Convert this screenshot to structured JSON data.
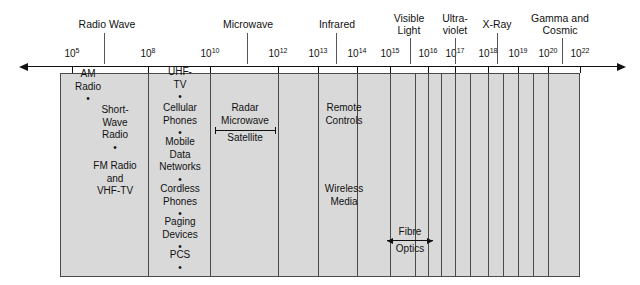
{
  "chart_data": {
    "type": "bar",
    "xlabel": "Frequency (Hz)",
    "ylabel": "",
    "axis_scale": "log10",
    "axis_arrow_left": true,
    "axis_arrow_right": true,
    "grid": false,
    "legend": "none",
    "tick_labels": [
      {
        "base": "10",
        "exp": "5",
        "x": 72
      },
      {
        "base": "10",
        "exp": "8",
        "x": 148
      },
      {
        "base": "10",
        "exp": "10",
        "x": 210
      },
      {
        "base": "10",
        "exp": "12",
        "x": 278
      },
      {
        "base": "10",
        "exp": "13",
        "x": 318
      },
      {
        "base": "10",
        "exp": "14",
        "x": 357
      },
      {
        "base": "10",
        "exp": "15",
        "x": 390
      },
      {
        "base": "10",
        "exp": "16",
        "x": 428
      },
      {
        "base": "10",
        "exp": "17",
        "x": 455
      },
      {
        "base": "10",
        "exp": "18",
        "x": 488
      },
      {
        "base": "10",
        "exp": "19",
        "x": 518
      },
      {
        "base": "10",
        "exp": "20",
        "x": 548
      },
      {
        "base": "10",
        "exp": "22",
        "x": 580
      }
    ],
    "categories": [
      {
        "label_line1": "Radio Wave",
        "label_line2": "",
        "x": 107,
        "leader_x": 104
      },
      {
        "label_line1": "Microwave",
        "label_line2": "",
        "x": 248,
        "leader_x": 247
      },
      {
        "label_line1": "Infrared",
        "label_line2": "",
        "x": 337,
        "leader_x": 336
      },
      {
        "label_line1": "Visible",
        "label_line2": "Light",
        "x": 409,
        "leader_x": 410
      },
      {
        "label_line1": "Ultra-",
        "label_line2": "violet",
        "x": 455,
        "leader_x": 455
      },
      {
        "label_line1": "X-Ray",
        "label_line2": "",
        "x": 497,
        "leader_x": 497
      },
      {
        "label_line1": "Gamma and",
        "label_line2": "Cosmic",
        "x": 560,
        "leader_x": 562
      }
    ],
    "band_dividers": [
      148,
      210,
      278,
      318,
      357,
      390,
      415,
      428,
      441,
      455,
      470,
      488,
      503,
      518,
      533,
      548
    ],
    "technologies": [
      {
        "text": "AM\nRadio\n•",
        "x": 88,
        "y": 68
      },
      {
        "text": "Short-\nWave\nRadio\n•",
        "x": 115,
        "y": 104
      },
      {
        "text": "FM Radio\nand\nVHF-TV",
        "x": 115,
        "y": 160
      },
      {
        "text": "UHF-\nTV\n•",
        "x": 180,
        "y": 66
      },
      {
        "text": "Cellular\nPhones\n•",
        "x": 180,
        "y": 102
      },
      {
        "text": "Mobile\nData\nNetworks\n•",
        "x": 180,
        "y": 136
      },
      {
        "text": "Cordless\nPhones\n•",
        "x": 180,
        "y": 183
      },
      {
        "text": "Paging\nDevices\n•",
        "x": 180,
        "y": 216
      },
      {
        "text": "PCS\n•",
        "x": 180,
        "y": 249
      },
      {
        "text": "Radar",
        "x": 245,
        "y": 102
      },
      {
        "text": "Microwave",
        "x": 245,
        "y": 115
      },
      {
        "text": "Satellite",
        "x": 245,
        "y": 132
      },
      {
        "text": "Remote\nControls",
        "x": 344,
        "y": 102
      },
      {
        "text": "Wireless\nMedia",
        "x": 344,
        "y": 183
      },
      {
        "text": "Fibre",
        "x": 410,
        "y": 226
      },
      {
        "text": "Optics",
        "x": 410,
        "y": 243
      }
    ],
    "span_bars": [
      {
        "name": "radar-microwave-satellite-span",
        "x1": 215,
        "x2": 275,
        "y": 130,
        "cap_style": "tick"
      },
      {
        "name": "fibre-optics-span",
        "x1": 387,
        "x2": 433,
        "y": 240,
        "cap_style": "arrow"
      }
    ]
  },
  "figure": {
    "band": {
      "left": 60,
      "top": 73,
      "right": 580,
      "bottom": 277
    },
    "axis": {
      "y": 66,
      "left": 28,
      "right": 617
    },
    "colors": {
      "band_fill": "#d9d9d9",
      "band_stroke": "#4a4a4a",
      "axis": "#111111",
      "text": "#111111",
      "background": "#ffffff"
    }
  }
}
